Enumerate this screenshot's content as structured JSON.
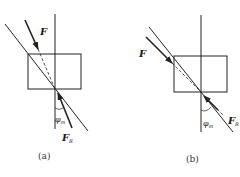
{
  "figure": {
    "panels": [
      {
        "id": "a",
        "caption": "(a)",
        "force_label": "F",
        "reaction_label": "F",
        "reaction_subscript": "R",
        "angle_label": "φ",
        "angle_subscript": "m"
      },
      {
        "id": "b",
        "caption": "(b)",
        "force_label": "F",
        "reaction_label": "F",
        "reaction_subscript": "R",
        "angle_label": "φ",
        "angle_subscript": "m"
      }
    ],
    "colors": {
      "line": "#222222",
      "background": "#ffffff"
    }
  }
}
